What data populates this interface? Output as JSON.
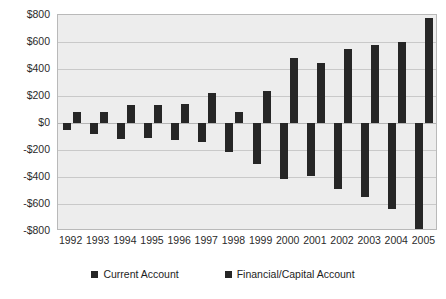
{
  "chart_data": {
    "type": "bar",
    "title": "",
    "subtitle": "",
    "xlabel": "",
    "ylabel": "",
    "ylim": [
      -800,
      800
    ],
    "ytick_step": 200,
    "grid": true,
    "legend_position": "bottom",
    "units": "$ billions",
    "categories": [
      "1992",
      "1993",
      "1994",
      "1995",
      "1996",
      "1997",
      "1998",
      "1999",
      "2000",
      "2001",
      "2002",
      "2003",
      "2004",
      "2005"
    ],
    "ytick_labels": [
      "$800",
      "$600",
      "$400",
      "$200",
      "$0",
      "-$200",
      "-$400",
      "-$600",
      "-$800"
    ],
    "ytick_values": [
      800,
      600,
      400,
      200,
      0,
      -200,
      -400,
      -600,
      -800
    ],
    "series": [
      {
        "name": "Current Account",
        "color": "#262626",
        "values": [
          -50,
          -85,
          -120,
          -110,
          -125,
          -140,
          -215,
          -300,
          -415,
          -390,
          -490,
          -545,
          -640,
          -790
        ]
      },
      {
        "name": "Financial/Capital Account",
        "color": "#262626",
        "values": [
          85,
          80,
          130,
          135,
          140,
          225,
          85,
          240,
          480,
          445,
          550,
          575,
          600,
          780
        ]
      }
    ]
  },
  "legend": {
    "entries": [
      {
        "label": "Current Account"
      },
      {
        "label": "Financial/Capital Account"
      }
    ]
  },
  "colors": {
    "bar": "#262626",
    "plot_background": "#ededed",
    "gridline": "#c9c9c9",
    "page_background": "#ffffff",
    "text": "#2b2b2b"
  }
}
